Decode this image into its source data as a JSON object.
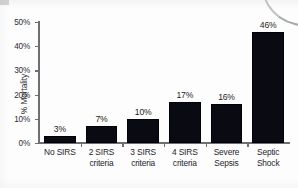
{
  "chart_data": {
    "type": "bar",
    "title": "",
    "xlabel": "",
    "ylabel": "% Mortality",
    "ylim": [
      0,
      50
    ],
    "grid": false,
    "legend": null,
    "categories": [
      "No SIRS",
      "2 SIRS criteria",
      "3 SIRS criteria",
      "4 SIRS criteria",
      "Severe Sepsis",
      "Septic Shock"
    ],
    "category_lines": [
      [
        "No SIRS"
      ],
      [
        "2 SIRS",
        "criteria"
      ],
      [
        "3 SIRS",
        "criteria"
      ],
      [
        "4 SIRS",
        "criteria"
      ],
      [
        "Severe",
        "Sepsis"
      ],
      [
        "Septic",
        "Shock"
      ]
    ],
    "values": [
      3,
      7,
      10,
      17,
      16,
      46
    ],
    "value_labels": [
      "3%",
      "7%",
      "10%",
      "17%",
      "16%",
      "46%"
    ],
    "ytick_values": [
      0,
      10,
      20,
      30,
      40,
      50
    ],
    "ytick_labels": [
      "0%",
      "10%",
      "20%",
      "30%",
      "40%",
      "50%"
    ],
    "bar_color": "#0a0a12",
    "axis_color": "#6e6e74",
    "text_color": "#26262b"
  }
}
